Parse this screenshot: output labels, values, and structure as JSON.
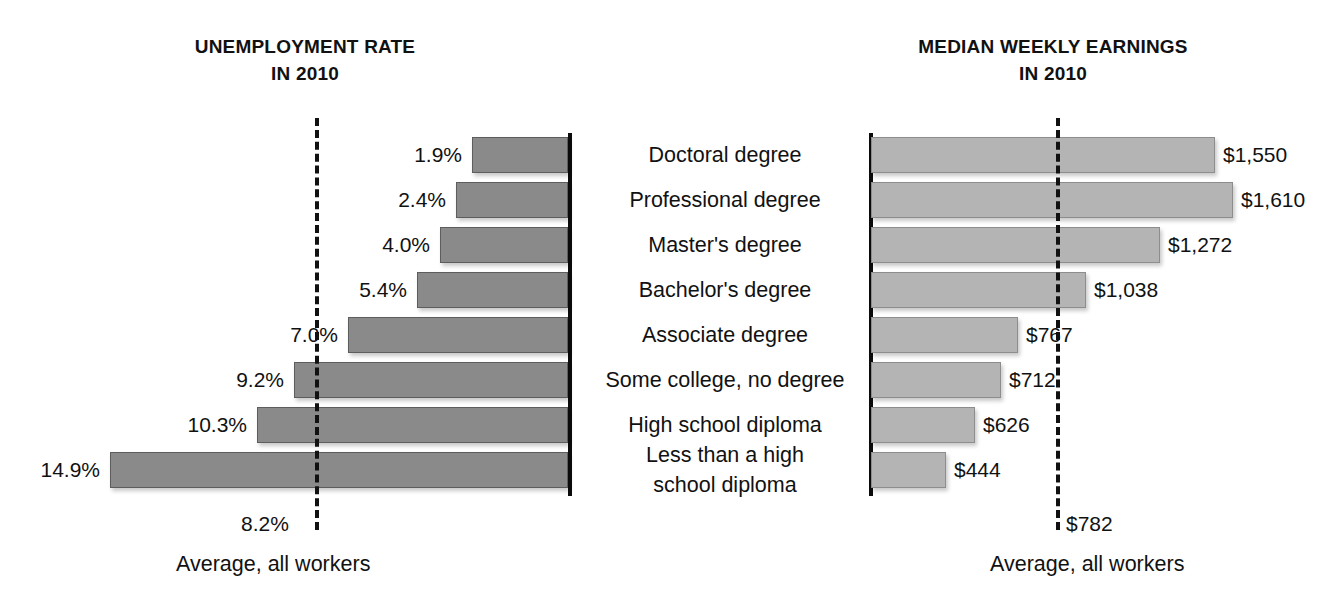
{
  "left_chart": {
    "title_line1": "UNEMPLOYMENT RATE",
    "title_line2": "IN 2010",
    "average_value": "8.2%",
    "average_caption": "Average, all workers"
  },
  "right_chart": {
    "title_line1": "MEDIAN WEEKLY EARNINGS",
    "title_line2": "IN 2010",
    "average_value": "$782",
    "average_caption": "Average, all workers"
  },
  "rows": [
    {
      "category": "Doctoral degree",
      "unemployment_label": "1.9%",
      "earnings_label": "$1,550"
    },
    {
      "category": "Professional degree",
      "unemployment_label": "2.4%",
      "earnings_label": "$1,610"
    },
    {
      "category": "Master's degree",
      "unemployment_label": "4.0%",
      "earnings_label": "$1,272"
    },
    {
      "category": "Bachelor's degree",
      "unemployment_label": "5.4%",
      "earnings_label": "$1,038"
    },
    {
      "category": "Associate degree",
      "unemployment_label": "7.0%",
      "earnings_label": "$767"
    },
    {
      "category": "Some college, no degree",
      "unemployment_label": "9.2%",
      "earnings_label": "$712"
    },
    {
      "category": "High school diploma",
      "unemployment_label": "10.3%",
      "earnings_label": "$626"
    },
    {
      "category": "Less than a high\nschool diploma",
      "unemployment_label": "14.9%",
      "earnings_label": "$444"
    }
  ],
  "colors": {
    "unemployment_bar": "#8a8a8a",
    "earnings_bar": "#b4b4b4",
    "axis": "#0c0c0c",
    "text": "#111111",
    "background": "#ffffff"
  },
  "chart_data": [
    {
      "type": "bar",
      "orientation": "horizontal-left",
      "title": "UNEMPLOYMENT RATE IN 2010",
      "xlabel": "Unemployment rate (%)",
      "ylabel": "",
      "categories": [
        "Doctoral degree",
        "Professional degree",
        "Master's degree",
        "Bachelor's degree",
        "Associate degree",
        "Some college, no degree",
        "High school diploma",
        "Less than a high school diploma"
      ],
      "values": [
        1.9,
        2.4,
        4.0,
        5.4,
        7.0,
        9.2,
        10.3,
        14.9
      ],
      "data_labels": [
        "1.9%",
        "2.4%",
        "4.0%",
        "5.4%",
        "7.0%",
        "9.2%",
        "10.3%",
        "14.9%"
      ],
      "xlim": [
        0,
        15
      ],
      "grid": false,
      "legend": "none",
      "annotations": [
        {
          "type": "reference-line",
          "label": "Average, all workers",
          "value": 8.2,
          "value_label": "8.2%",
          "style": "dashed"
        }
      ]
    },
    {
      "type": "bar",
      "orientation": "horizontal-right",
      "title": "MEDIAN WEEKLY EARNINGS IN 2010",
      "xlabel": "Median weekly earnings (US dollars)",
      "ylabel": "",
      "categories": [
        "Doctoral degree",
        "Professional degree",
        "Master's degree",
        "Bachelor's degree",
        "Associate degree",
        "Some college, no degree",
        "High school diploma",
        "Less than a high school diploma"
      ],
      "values": [
        1550,
        1610,
        1272,
        1038,
        767,
        712,
        626,
        444
      ],
      "data_labels": [
        "$1,550",
        "$1,610",
        "$1,272",
        "$1,038",
        "$767",
        "$712",
        "$626",
        "$444"
      ],
      "xlim": [
        0,
        1700
      ],
      "grid": false,
      "legend": "none",
      "annotations": [
        {
          "type": "reference-line",
          "label": "Average, all workers",
          "value": 782,
          "value_label": "$782",
          "style": "dashed"
        }
      ]
    }
  ],
  "geometry": {
    "row_tops": [
      137,
      182,
      227,
      272,
      317,
      362,
      407,
      452
    ],
    "left_axis_x": 568,
    "right_axis_x": 869,
    "left_bar_starts": [
      472,
      456,
      440,
      417,
      348,
      294,
      257,
      110
    ],
    "right_bar_ends": [
      1215,
      1233,
      1160,
      1086,
      1018,
      1001,
      975,
      946
    ],
    "left_label_rights": [
      462,
      446,
      430,
      407,
      338,
      284,
      247,
      100
    ],
    "right_label_lefts": [
      1223,
      1241,
      1168,
      1094,
      1026,
      1009,
      983,
      954
    ]
  }
}
